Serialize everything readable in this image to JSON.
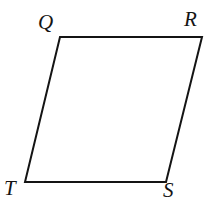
{
  "figure": {
    "kind": "parallelogram",
    "name": "QRST",
    "stroke_color": "#141414",
    "fill_color": "#ffffff",
    "background_color": "#ffffff",
    "stroke_width": 2,
    "canvas": {
      "width": 211,
      "height": 206
    },
    "vertices": [
      {
        "id": "Q",
        "label": "Q",
        "x": 60,
        "y": 37,
        "label_x": 38,
        "label_y": 12
      },
      {
        "id": "R",
        "label": "R",
        "x": 202,
        "y": 37,
        "label_x": 184,
        "label_y": 9
      },
      {
        "id": "S",
        "label": "S",
        "x": 166,
        "y": 182,
        "label_x": 163,
        "label_y": 180
      },
      {
        "id": "T",
        "label": "T",
        "x": 25,
        "y": 182,
        "label_x": 4,
        "label_y": 178
      }
    ],
    "edges": [
      {
        "id": "QR",
        "from": "Q",
        "to": "R"
      },
      {
        "id": "RS",
        "from": "R",
        "to": "S"
      },
      {
        "id": "ST",
        "from": "S",
        "to": "T"
      },
      {
        "id": "TQ",
        "from": "T",
        "to": "Q"
      }
    ],
    "path_points": "60,37 202,37 166,182 25,182"
  }
}
